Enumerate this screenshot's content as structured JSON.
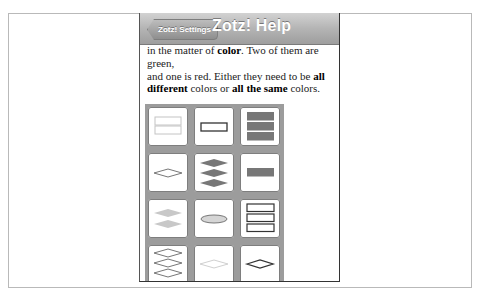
{
  "navbar": {
    "back_label": "Zotz! Settings",
    "title": "Zotz! Help"
  },
  "content": {
    "line1_pre": "in the matter of ",
    "line1_bold": "color",
    "line1_post": ". Two of them are green,",
    "line2_pre": "and one is red. Either they need to be ",
    "line2_bold": "all",
    "line3_bold1": "different",
    "line3_mid": " colors or ",
    "line3_bold2": "all the same",
    "line3_post": " colors."
  },
  "cards": [
    {
      "shape": "rectangle",
      "count": 2,
      "fill": "empty",
      "color": "light"
    },
    {
      "shape": "rectangle",
      "count": 1,
      "fill": "empty",
      "color": "dark"
    },
    {
      "shape": "rectangle",
      "count": 3,
      "fill": "solid",
      "color": "medium"
    },
    {
      "shape": "diamond",
      "count": 1,
      "fill": "empty",
      "color": "medium"
    },
    {
      "shape": "diamond",
      "count": 3,
      "fill": "solid",
      "color": "medium"
    },
    {
      "shape": "rectangle",
      "count": 1,
      "fill": "solid",
      "color": "medium"
    },
    {
      "shape": "diamond",
      "count": 2,
      "fill": "solid",
      "color": "light"
    },
    {
      "shape": "oval",
      "count": 1,
      "fill": "striped",
      "color": "medium"
    },
    {
      "shape": "rectangle",
      "count": 3,
      "fill": "empty",
      "color": "dark"
    },
    {
      "shape": "diamond",
      "count": 3,
      "fill": "empty",
      "color": "medium"
    },
    {
      "shape": "diamond",
      "count": 1,
      "fill": "empty",
      "color": "light"
    },
    {
      "shape": "diamond",
      "count": 1,
      "fill": "empty",
      "color": "dark"
    }
  ],
  "colors": {
    "navbar_top": "#d2d2d2",
    "navbar_bottom": "#9e9e9e",
    "grid_bg": "#9c9c9c",
    "shape_dark": "#333333",
    "shape_medium": "#777777",
    "shape_light": "#c4c4c4"
  }
}
